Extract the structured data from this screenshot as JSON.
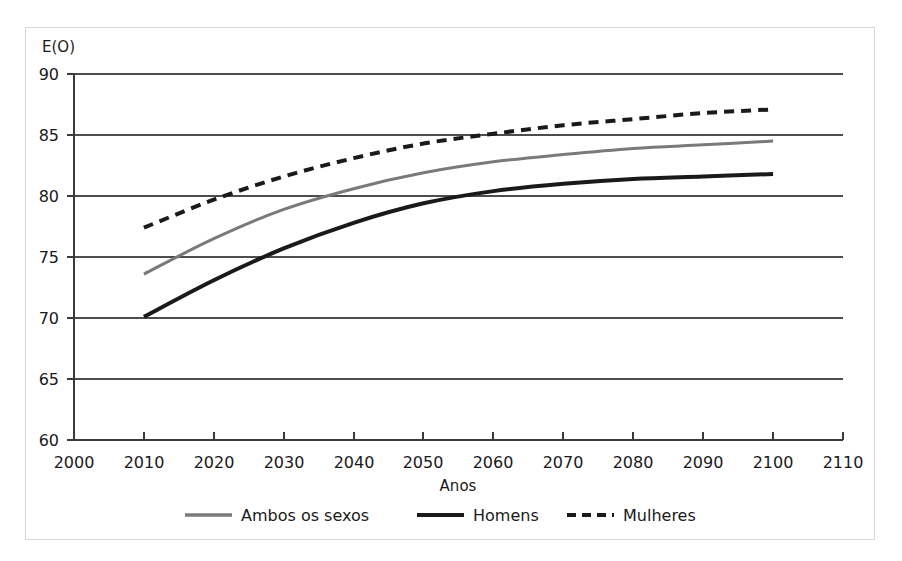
{
  "chart_data": {
    "type": "line",
    "title": "",
    "subtitle": "",
    "xlabel": "Anos",
    "ylabel": "E(O)",
    "xlim": [
      2000,
      2110
    ],
    "ylim": [
      60,
      90
    ],
    "xticks": [
      "2000",
      "2010",
      "2020",
      "2030",
      "2040",
      "2050",
      "2060",
      "2070",
      "2080",
      "2090",
      "2100",
      "2110"
    ],
    "yticks": [
      "60",
      "65",
      "70",
      "75",
      "80",
      "85",
      "90"
    ],
    "grid": "horizontal",
    "legend_position": "bottom",
    "x": [
      2010,
      2020,
      2030,
      2040,
      2050,
      2060,
      2070,
      2080,
      2090,
      2100
    ],
    "series": [
      {
        "name": "Ambos os sexos",
        "style": "solid",
        "color": "#7a7a7a",
        "width": 3,
        "values": [
          73.6,
          76.5,
          78.9,
          80.6,
          81.9,
          82.8,
          83.4,
          83.9,
          84.2,
          84.5
        ]
      },
      {
        "name": "Homens",
        "style": "solid",
        "color": "#1a1a1a",
        "width": 4,
        "values": [
          70.1,
          73.1,
          75.7,
          77.8,
          79.4,
          80.4,
          81.0,
          81.4,
          81.6,
          81.8
        ]
      },
      {
        "name": "Mulheres",
        "style": "dashed",
        "color": "#1a1a1a",
        "width": 4,
        "values": [
          77.4,
          79.7,
          81.6,
          83.1,
          84.3,
          85.1,
          85.8,
          86.3,
          86.8,
          87.1
        ]
      }
    ]
  },
  "axes": {
    "y_axis_title": "E(O)",
    "x_axis_title": "Anos",
    "y_tick_labels": [
      "90",
      "85",
      "80",
      "75",
      "70",
      "65",
      "60"
    ],
    "x_tick_labels": [
      "2000",
      "2010",
      "2020",
      "2030",
      "2040",
      "2050",
      "2060",
      "2070",
      "2080",
      "2090",
      "2100",
      "2110"
    ]
  },
  "legend": {
    "items": [
      {
        "label": "Ambos os sexos",
        "swatch": "gray-solid-line-swatch"
      },
      {
        "label": "Homens",
        "swatch": "black-solid-line-swatch"
      },
      {
        "label": "Mulheres",
        "swatch": "black-dashed-line-swatch"
      }
    ]
  },
  "colors": {
    "ambos": "#7a7a7a",
    "homens": "#1a1a1a",
    "mulheres": "#1a1a1a",
    "grid": "#4d4d4d",
    "axis": "#3a3a3a",
    "frame": "#d8d8d8",
    "background": "#ffffff"
  }
}
